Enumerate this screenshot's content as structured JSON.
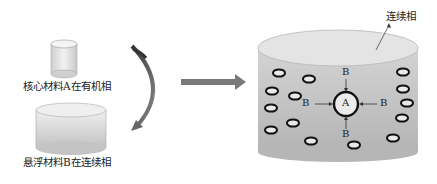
{
  "left": {
    "core_label": "核心材料A在有机相",
    "suspend_label": "悬浮材料B在连续相"
  },
  "right": {
    "phase_label": "连续相",
    "center_label": "A",
    "b_labels": {
      "top": "B",
      "left": "B",
      "right": "B",
      "bottom": "B"
    }
  },
  "colors": {
    "cylinder_gray": "#bdbdbd",
    "arrow_gray": "#777777",
    "ring_stroke": "#111111"
  }
}
